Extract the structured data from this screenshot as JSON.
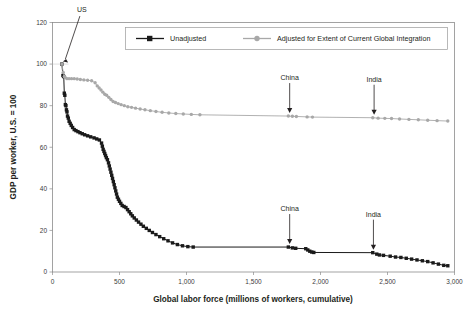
{
  "chart_data": {
    "type": "line",
    "title": "",
    "xlabel": "Global labor force (millions of workers, cumulative)",
    "ylabel": "GDP per worker, U.S. = 100",
    "xlim": [
      0,
      3000
    ],
    "ylim": [
      0,
      120
    ],
    "xticks": [
      0,
      500,
      1000,
      1500,
      2000,
      2500,
      3000
    ],
    "xtick_labels": [
      "0",
      "500",
      "1,000",
      "1,500",
      "2,000",
      "2,500",
      "3,000"
    ],
    "yticks": [
      0,
      20,
      40,
      60,
      80,
      100,
      120
    ],
    "ytick_labels": [
      "0",
      "20",
      "40",
      "60",
      "80",
      "100",
      "120"
    ],
    "grid": false,
    "legend_position": "top-center",
    "series": [
      {
        "name": "Unadjusted",
        "color": "#1a1a1a",
        "marker": "square",
        "points": [
          [
            70,
            100.0
          ],
          [
            78,
            94.5
          ],
          [
            84,
            94.0
          ],
          [
            88,
            86.0
          ],
          [
            92,
            85.0
          ],
          [
            96,
            80.5
          ],
          [
            100,
            80.0
          ],
          [
            104,
            78.0
          ],
          [
            108,
            77.0
          ],
          [
            112,
            75.0
          ],
          [
            118,
            74.0
          ],
          [
            124,
            72.5
          ],
          [
            132,
            71.5
          ],
          [
            140,
            70.5
          ],
          [
            150,
            69.5
          ],
          [
            162,
            68.5
          ],
          [
            175,
            68.0
          ],
          [
            190,
            67.5
          ],
          [
            205,
            67.0
          ],
          [
            222,
            66.5
          ],
          [
            240,
            66.0
          ],
          [
            262,
            65.5
          ],
          [
            285,
            65.0
          ],
          [
            310,
            64.5
          ],
          [
            330,
            64.0
          ],
          [
            350,
            63.5
          ],
          [
            366,
            62.0
          ],
          [
            372,
            60.5
          ],
          [
            378,
            59.0
          ],
          [
            384,
            58.0
          ],
          [
            390,
            57.0
          ],
          [
            396,
            56.0
          ],
          [
            402,
            55.0
          ],
          [
            410,
            54.0
          ],
          [
            418,
            52.5
          ],
          [
            424,
            51.0
          ],
          [
            430,
            49.5
          ],
          [
            436,
            48.0
          ],
          [
            442,
            46.5
          ],
          [
            448,
            45.0
          ],
          [
            454,
            43.5
          ],
          [
            460,
            42.0
          ],
          [
            466,
            40.5
          ],
          [
            472,
            39.0
          ],
          [
            478,
            37.5
          ],
          [
            484,
            36.0
          ],
          [
            492,
            35.0
          ],
          [
            500,
            34.0
          ],
          [
            510,
            33.0
          ],
          [
            520,
            32.0
          ],
          [
            534,
            31.5
          ],
          [
            548,
            31.0
          ],
          [
            560,
            30.0
          ],
          [
            572,
            29.0
          ],
          [
            584,
            28.0
          ],
          [
            596,
            27.0
          ],
          [
            610,
            26.0
          ],
          [
            626,
            25.0
          ],
          [
            642,
            24.0
          ],
          [
            660,
            23.0
          ],
          [
            678,
            22.0
          ],
          [
            700,
            21.0
          ],
          [
            722,
            20.0
          ],
          [
            746,
            19.0
          ],
          [
            772,
            18.0
          ],
          [
            800,
            17.0
          ],
          [
            830,
            16.0
          ],
          [
            862,
            15.0
          ],
          [
            896,
            14.0
          ],
          [
            932,
            13.2
          ],
          [
            970,
            12.6
          ],
          [
            1010,
            12.2
          ],
          [
            1050,
            12.0
          ],
          [
            1760,
            12.0
          ],
          [
            1790,
            11.6
          ],
          [
            1815,
            11.4
          ],
          [
            1890,
            11.2
          ],
          [
            1905,
            10.6
          ],
          [
            1920,
            10.0
          ],
          [
            1935,
            9.6
          ],
          [
            1950,
            9.4
          ],
          [
            2390,
            9.3
          ],
          [
            2420,
            8.6
          ],
          [
            2440,
            8.2
          ],
          [
            2470,
            8.0
          ],
          [
            2520,
            7.6
          ],
          [
            2560,
            7.2
          ],
          [
            2600,
            7.0
          ],
          [
            2640,
            6.6
          ],
          [
            2680,
            6.2
          ],
          [
            2720,
            5.8
          ],
          [
            2760,
            5.4
          ],
          [
            2800,
            5.0
          ],
          [
            2840,
            4.4
          ],
          [
            2880,
            3.8
          ],
          [
            2920,
            3.2
          ],
          [
            2950,
            3.0
          ]
        ]
      },
      {
        "name": "Adjusted for Extent of Current Global Integration",
        "color": "#a8a8a8",
        "marker": "circle",
        "points": [
          [
            70,
            100.0
          ],
          [
            80,
            96.0
          ],
          [
            88,
            94.0
          ],
          [
            96,
            93.5
          ],
          [
            108,
            93.0
          ],
          [
            124,
            93.0
          ],
          [
            142,
            93.0
          ],
          [
            162,
            93.0
          ],
          [
            184,
            92.8
          ],
          [
            208,
            92.6
          ],
          [
            234,
            92.4
          ],
          [
            262,
            92.2
          ],
          [
            292,
            92.0
          ],
          [
            318,
            91.0
          ],
          [
            334,
            89.5
          ],
          [
            348,
            88.5
          ],
          [
            362,
            87.5
          ],
          [
            376,
            86.5
          ],
          [
            390,
            85.5
          ],
          [
            404,
            85.0
          ],
          [
            420,
            84.0
          ],
          [
            436,
            83.0
          ],
          [
            452,
            82.0
          ],
          [
            470,
            81.5
          ],
          [
            490,
            81.0
          ],
          [
            512,
            80.5
          ],
          [
            536,
            80.0
          ],
          [
            562,
            79.5
          ],
          [
            590,
            79.2
          ],
          [
            620,
            78.8
          ],
          [
            654,
            78.4
          ],
          [
            690,
            78.0
          ],
          [
            730,
            77.6
          ],
          [
            772,
            77.2
          ],
          [
            818,
            76.8
          ],
          [
            868,
            76.5
          ],
          [
            920,
            76.2
          ],
          [
            976,
            76.0
          ],
          [
            1036,
            75.8
          ],
          [
            1100,
            75.6
          ],
          [
            1760,
            75.0
          ],
          [
            1790,
            74.9
          ],
          [
            1820,
            74.8
          ],
          [
            1900,
            74.6
          ],
          [
            1940,
            74.5
          ],
          [
            2390,
            74.2
          ],
          [
            2430,
            74.0
          ],
          [
            2480,
            73.9
          ],
          [
            2530,
            73.8
          ],
          [
            2590,
            73.6
          ],
          [
            2660,
            73.4
          ],
          [
            2730,
            73.2
          ],
          [
            2800,
            73.0
          ],
          [
            2870,
            72.8
          ],
          [
            2950,
            72.6
          ]
        ]
      }
    ],
    "annotations": [
      {
        "id": "us",
        "label": "US",
        "series": "both",
        "x": 70,
        "y": 100
      },
      {
        "id": "china-adjusted",
        "label": "China",
        "series": "Adjusted for Extent of Current Global Integration",
        "x": 1770,
        "y": 75
      },
      {
        "id": "india-adjusted",
        "label": "India",
        "series": "Adjusted for Extent of Current Global Integration",
        "x": 2400,
        "y": 74.2
      },
      {
        "id": "china-unadjusted",
        "label": "China",
        "series": "Unadjusted",
        "x": 1770,
        "y": 12
      },
      {
        "id": "india-unadjusted",
        "label": "India",
        "series": "Unadjusted",
        "x": 2395,
        "y": 9.3
      }
    ]
  },
  "legend": {
    "entries": [
      {
        "label": "Unadjusted",
        "color": "#1a1a1a"
      },
      {
        "label": "Adjusted for Extent of Current Global Integration",
        "color": "#a8a8a8"
      }
    ]
  },
  "colors": {
    "unadjusted": "#1a1a1a",
    "adjusted": "#a8a8a8",
    "axis": "#8c8c8c",
    "text": "#231f20"
  }
}
